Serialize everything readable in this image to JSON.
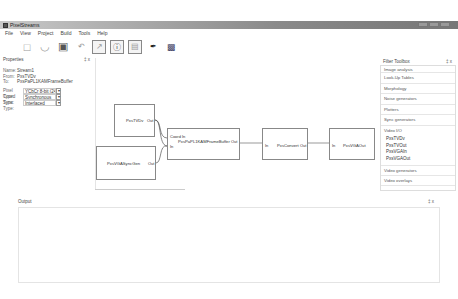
{
  "window": {
    "title": "PixelStreams"
  },
  "menu": [
    "File",
    "View",
    "Project",
    "Build",
    "Tools",
    "Help"
  ],
  "toolbar": {
    "icons": [
      "new-file-icon",
      "open-file-icon",
      "save-icon",
      "undo-icon",
      "edit-icon",
      "info-icon",
      "window-icon",
      "brush-icon",
      "build-icon"
    ]
  },
  "properties": {
    "title": "Properties",
    "pin": "‡ x",
    "rows": [
      {
        "k": "Name:",
        "v": "Stream1"
      },
      {
        "k": "From:",
        "v": "PxsTVDv"
      },
      {
        "k": "To:",
        "v": "PxsPaPL1KAMFrameBuffer"
      }
    ],
    "combos": [
      {
        "k": "Pixel Type:",
        "v": "YCbCr 8-bit (24-bit)"
      },
      {
        "k": "Coord Type:",
        "v": "Synchronous"
      },
      {
        "k": "Sync Type:",
        "v": "Interlaced"
      }
    ]
  },
  "canvas": {
    "nodes": [
      {
        "id": "n1",
        "label": "PxsTVDv",
        "out": "Out"
      },
      {
        "id": "n2",
        "label": "PxsVGASyncGen",
        "out": "Out"
      },
      {
        "id": "n3",
        "label": "PxsPaPL1KAMFrameBuffer",
        "in1": "Coord In",
        "in2": "In",
        "out": "Out"
      },
      {
        "id": "n4",
        "label": "PxsConvert",
        "in": "In",
        "out": "Out"
      },
      {
        "id": "n5",
        "label": "PxsVGAOut",
        "in": "In"
      }
    ]
  },
  "filter_toolbox": {
    "title": "Filter Toolbox",
    "pin": "‡ x",
    "categories": [
      "Image analysis",
      "Look-Up Tables",
      "Morphology",
      "Noise generators",
      "Plotters",
      "Sync generators",
      "Video I/O"
    ],
    "video_io_items": [
      "PxsTVDv",
      "PxsTVOut",
      "PxsVGAIn",
      "PxsVGAOut"
    ],
    "after": [
      "Video generators",
      "Video overlays"
    ]
  },
  "output": {
    "title": "Output",
    "pin": "‡ x"
  }
}
